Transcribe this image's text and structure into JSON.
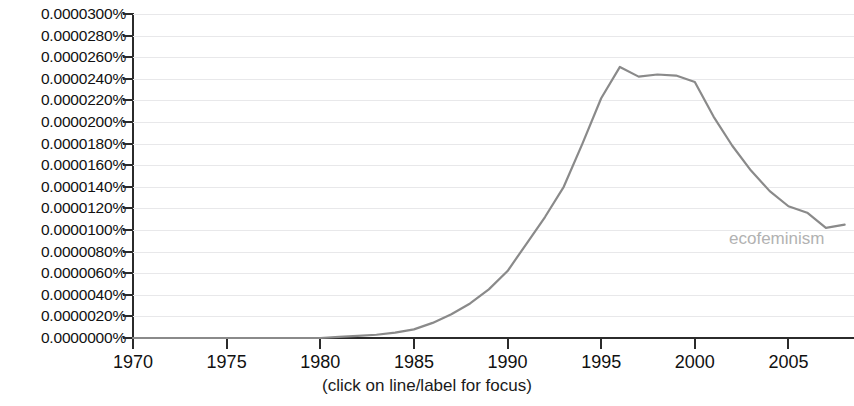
{
  "caption": "(click on line/label for focus)",
  "axes": {
    "y_tick_labels": [
      "0.0000300%",
      "0.0000280%",
      "0.0000260%",
      "0.0000240%",
      "0.0000220%",
      "0.0000200%",
      "0.0000180%",
      "0.0000160%",
      "0.0000140%",
      "0.0000120%",
      "0.0000100%",
      "0.0000080%",
      "0.0000060%",
      "0.0000040%",
      "0.0000020%",
      "0.0000000%"
    ],
    "x_tick_labels": [
      "1970",
      "1975",
      "1980",
      "1985",
      "1990",
      "1995",
      "2000",
      "2005"
    ]
  },
  "series_label": "ecofeminism",
  "colors": {
    "line": "#8a8a8a",
    "label": "#b2b2b2",
    "axis": "#2b2b2b",
    "grid": "#e8e8ea",
    "background": "#ffffff"
  },
  "chart_data": {
    "type": "line",
    "title": "",
    "subtitle": "",
    "xlabel": "",
    "ylabel": "",
    "xlim": [
      1970,
      2008.5
    ],
    "ylim": [
      0.0,
      3e-05
    ],
    "y_tick_step": 2e-06,
    "x_tick_step": 5,
    "grid": true,
    "legend_position": "inline-right",
    "annotations": [
      {
        "text": "(click on line/label for focus)",
        "position": "bottom-center"
      }
    ],
    "series": [
      {
        "name": "ecofeminism",
        "color": "#8a8a8a",
        "x": [
          1970,
          1971,
          1972,
          1973,
          1974,
          1975,
          1976,
          1977,
          1978,
          1979,
          1980,
          1981,
          1982,
          1983,
          1984,
          1985,
          1986,
          1987,
          1988,
          1989,
          1990,
          1991,
          1992,
          1993,
          1994,
          1995,
          1996,
          1997,
          1998,
          1999,
          2000,
          2001,
          2002,
          2003,
          2004,
          2005,
          2006,
          2007,
          2008
        ],
        "values": [
          0.0,
          0.0,
          0.0,
          0.0,
          0.0,
          0.0,
          0.0,
          0.0,
          0.0,
          0.0,
          0.0,
          1e-07,
          2e-07,
          3e-07,
          5e-07,
          8e-07,
          1.4e-06,
          2.2e-06,
          3.2e-06,
          4.5e-06,
          6.2e-06,
          8.7e-06,
          1.12e-05,
          1.4e-05,
          1.8e-05,
          2.22e-05,
          2.51e-05,
          2.42e-05,
          2.44e-05,
          2.43e-05,
          2.37e-05,
          2.05e-05,
          1.78e-05,
          1.55e-05,
          1.36e-05,
          1.22e-05,
          1.16e-05,
          1.02e-05,
          1.05e-05
        ]
      }
    ]
  }
}
